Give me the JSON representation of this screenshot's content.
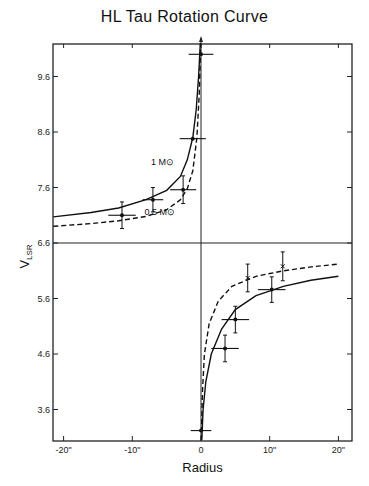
{
  "chart_data": {
    "type": "scatter",
    "title": "HL Tau Rotation Curve",
    "xlabel": "Radius",
    "ylabel": "V",
    "ylabel_subscript": "LSR",
    "xlim": [
      -21.5,
      21.5
    ],
    "ylim": [
      3.05,
      10.2
    ],
    "x_ticks": [
      -20,
      -10,
      0,
      10,
      20
    ],
    "x_tick_labels": [
      "-20\"",
      "-10\"",
      "0",
      "10\"",
      "20\""
    ],
    "y_ticks": [
      3.6,
      4.6,
      5.6,
      6.6,
      7.6,
      8.6,
      9.6
    ],
    "y_tick_labels": [
      "3.6",
      "4.6",
      "5.6",
      "6.6",
      "7.6",
      "8.6",
      "9.6"
    ],
    "grid": false,
    "reference_lines": {
      "horizontal_v": 6.6,
      "vertical_r": 0
    },
    "series": [
      {
        "name": "Observed (filled points)",
        "marker": "dot",
        "points": [
          {
            "r": -11.5,
            "v": 7.1,
            "r_err": 2.0,
            "v_err": 0.24
          },
          {
            "r": -7.0,
            "v": 7.38,
            "r_err": 1.5,
            "v_err": 0.22
          },
          {
            "r": -2.6,
            "v": 7.56,
            "r_err": 1.9,
            "v_err": 0.25
          },
          {
            "r": -1.2,
            "v": 8.48,
            "r_err": 1.9,
            "v_err": 0.0
          },
          {
            "r": 0.0,
            "v": 10.0,
            "r_err": 1.8,
            "v_err": 0.0
          },
          {
            "r": 0.0,
            "v": 3.22,
            "r_err": 1.5,
            "v_err": 0.0
          },
          {
            "r": 3.5,
            "v": 4.7,
            "r_err": 2.0,
            "v_err": 0.24
          },
          {
            "r": 5.0,
            "v": 5.22,
            "r_err": 2.0,
            "v_err": 0.24
          },
          {
            "r": 10.3,
            "v": 5.76,
            "r_err": 2.0,
            "v_err": 0.23
          }
        ]
      },
      {
        "name": "Observed (cross points)",
        "marker": "x",
        "points": [
          {
            "r": 6.8,
            "v": 5.97,
            "r_err": 0,
            "v_err": 0.25
          },
          {
            "r": 11.9,
            "v": 6.18,
            "r_err": 0,
            "v_err": 0.26
          }
        ]
      },
      {
        "name": "1 M⊙ (Keplerian)",
        "style": "solid",
        "label": "1 M⊙",
        "curve": [
          {
            "r": -21.5,
            "v": 7.07
          },
          {
            "r": -16,
            "v": 7.15
          },
          {
            "r": -12,
            "v": 7.23
          },
          {
            "r": -8,
            "v": 7.38
          },
          {
            "r": -5,
            "v": 7.55
          },
          {
            "r": -3,
            "v": 7.8
          },
          {
            "r": -2,
            "v": 8.1
          },
          {
            "r": -1.2,
            "v": 8.5
          },
          {
            "r": -0.7,
            "v": 9.0
          },
          {
            "r": -0.35,
            "v": 9.6
          },
          {
            "r": -0.1,
            "v": 10.2
          },
          {
            "r": 0.12,
            "v": 3.05
          },
          {
            "r": 0.3,
            "v": 3.6
          },
          {
            "r": 0.7,
            "v": 4.1
          },
          {
            "r": 1.5,
            "v": 4.6
          },
          {
            "r": 3,
            "v": 5.05
          },
          {
            "r": 5,
            "v": 5.4
          },
          {
            "r": 8,
            "v": 5.65
          },
          {
            "r": 12,
            "v": 5.82
          },
          {
            "r": 16,
            "v": 5.93
          },
          {
            "r": 20,
            "v": 6.0
          }
        ]
      },
      {
        "name": "0.5 M⊙ (Keplerian)",
        "style": "dashed",
        "label": "0.5 M⊙",
        "curve": [
          {
            "r": -21.5,
            "v": 6.9
          },
          {
            "r": -16,
            "v": 6.95
          },
          {
            "r": -12,
            "v": 7.0
          },
          {
            "r": -8,
            "v": 7.08
          },
          {
            "r": -5,
            "v": 7.2
          },
          {
            "r": -3,
            "v": 7.38
          },
          {
            "r": -2,
            "v": 7.58
          },
          {
            "r": -1.2,
            "v": 7.9
          },
          {
            "r": -0.6,
            "v": 8.5
          },
          {
            "r": -0.25,
            "v": 9.3
          },
          {
            "r": -0.05,
            "v": 10.2
          },
          {
            "r": 0.05,
            "v": 3.05
          },
          {
            "r": 0.2,
            "v": 3.9
          },
          {
            "r": 0.5,
            "v": 4.6
          },
          {
            "r": 1.2,
            "v": 5.15
          },
          {
            "r": 2.5,
            "v": 5.55
          },
          {
            "r": 4.5,
            "v": 5.82
          },
          {
            "r": 8,
            "v": 6.0
          },
          {
            "r": 12,
            "v": 6.1
          },
          {
            "r": 16,
            "v": 6.17
          },
          {
            "r": 20,
            "v": 6.22
          }
        ]
      }
    ],
    "annotations": [
      {
        "text": "1 M⊙",
        "r": -5.6,
        "v": 8.0
      },
      {
        "text": "0.5 M⊙",
        "r": -6.0,
        "v": 7.1
      }
    ]
  }
}
